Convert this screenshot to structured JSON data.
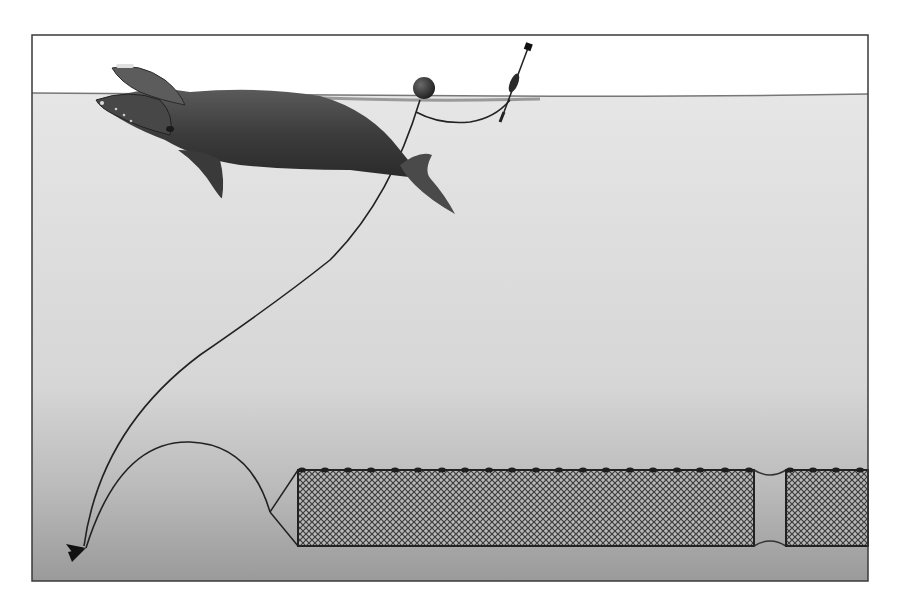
{
  "figure": {
    "frame": {
      "x": 32,
      "y": 35,
      "width": 836,
      "height": 546,
      "stroke": "#3a3a3a"
    },
    "colors": {
      "sky": "#ffffff",
      "water_top": "#e4e4e4",
      "water_mid": "#d2d2d2",
      "water_bottom": "#9c9c9c",
      "whale_body": "#4a4a4a",
      "whale_dark": "#262626",
      "line": "#2a2a2a",
      "net_fill": "#8c8c8c",
      "net_light": "#d8d8d8",
      "float": "#2b2b2b"
    },
    "elements": [
      "right-whale",
      "surface-buoy",
      "high-flyer-marker",
      "vertical-buoy-line",
      "anchor",
      "groundline",
      "gillnet-panel-1",
      "gillnet-panel-2",
      "float-line"
    ]
  }
}
